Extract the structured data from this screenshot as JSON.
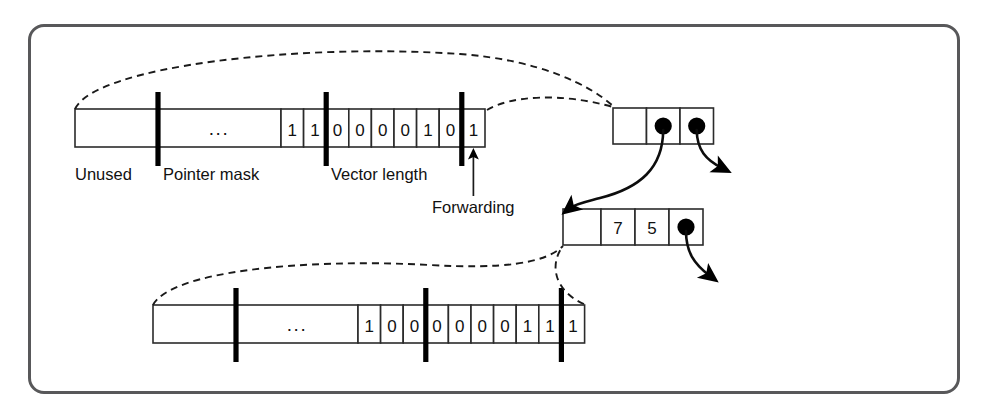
{
  "figure": {
    "frame_color": "#58585a",
    "background": "#ffffff"
  },
  "labels": {
    "unused": "Unused",
    "pointer_mask": "Pointer mask",
    "vector_length": "Vector length",
    "forwarding": "Forwarding",
    "ellipsis": "..."
  },
  "top_header": {
    "name": "top-header-word",
    "ellipsis": "...",
    "bits": [
      "1",
      "1",
      "0",
      "0",
      "0",
      "0",
      "1",
      "0",
      "1"
    ],
    "field_separators_after_bit": [
      2,
      9
    ],
    "forwarding_bit_value": "1"
  },
  "bottom_header": {
    "name": "bottom-header-word",
    "ellipsis": "...",
    "bits": [
      "1",
      "0",
      "0",
      "0",
      "0",
      "0",
      "0",
      "1",
      "1",
      "1"
    ],
    "field_separators_after_bit": [
      3,
      9
    ]
  },
  "top_right_block": {
    "name": "top-right-object",
    "cells": [
      "",
      "●",
      "●"
    ]
  },
  "middle_block": {
    "name": "middle-object",
    "cells": [
      "",
      "7",
      "5",
      "●"
    ]
  },
  "icons": {
    "pointer_dot": "filled-dot-icon",
    "arrow": "arrow-icon",
    "dashed_link": "dashed-link-icon"
  }
}
